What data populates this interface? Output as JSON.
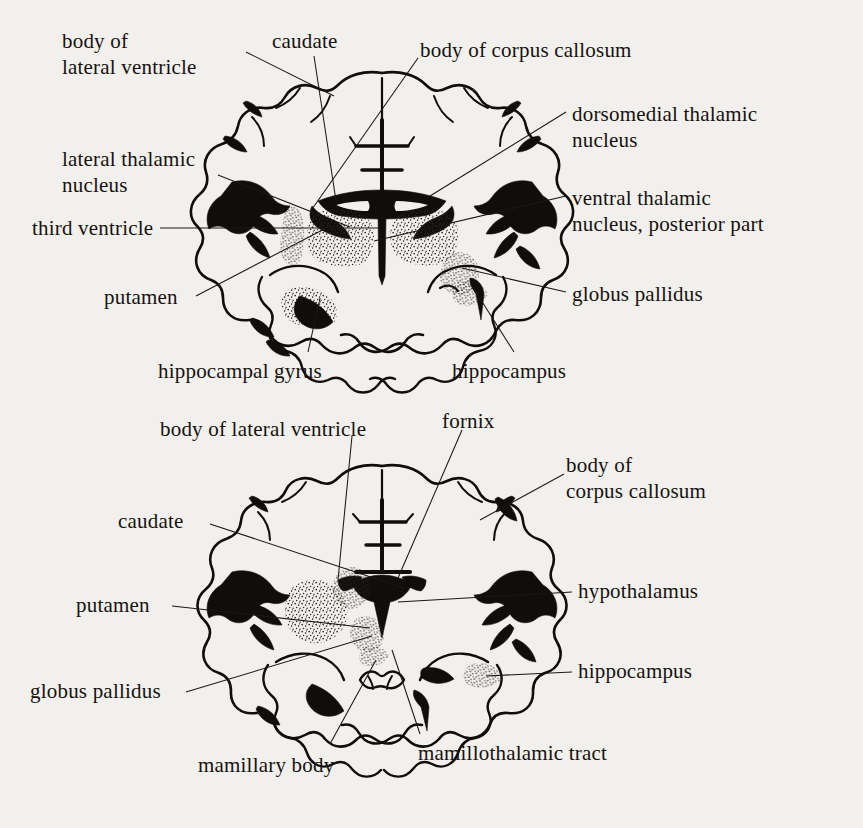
{
  "document": {
    "type": "anatomical-illustration",
    "subject": "Coronal sections of the human brain",
    "background_color": "#f2f0ec",
    "ink_color": "#16120f"
  },
  "figures": [
    {
      "id": "upper-coronal-section",
      "name": "Coronal section at the level of the thalamus",
      "labels": [
        {
          "id": "body-of-lateral-ventricle",
          "text": "body of\nlateral ventricle",
          "align": "left",
          "x": 62,
          "y": 28
        },
        {
          "id": "caudate",
          "text": "caudate",
          "align": "left",
          "x": 272,
          "y": 28
        },
        {
          "id": "body-of-corpus-callosum",
          "text": "body of corpus callosum",
          "align": "left",
          "x": 420,
          "y": 37
        },
        {
          "id": "dorsomedial-thalamic-nucleus",
          "text": "dorsomedial thalamic\nnucleus",
          "align": "left",
          "x": 572,
          "y": 101
        },
        {
          "id": "lateral-thalamic-nucleus",
          "text": "lateral thalamic\nnucleus",
          "align": "left",
          "x": 62,
          "y": 146
        },
        {
          "id": "ventral-thalamic-nucleus",
          "text": "ventral thalamic\nnucleus, posterior part",
          "align": "left",
          "x": 572,
          "y": 185
        },
        {
          "id": "third-ventricle",
          "text": "third ventricle",
          "align": "left",
          "x": 32,
          "y": 225
        },
        {
          "id": "globus-pallidus",
          "text": "globus pallidus",
          "align": "left",
          "x": 572,
          "y": 283
        },
        {
          "id": "putamen",
          "text": "putamen",
          "align": "left",
          "x": 104,
          "y": 293
        },
        {
          "id": "hippocampal-gyrus",
          "text": "hippocampal gyrus",
          "align": "left",
          "x": 158,
          "y": 360
        },
        {
          "id": "hippocampus",
          "text": "hippocampus",
          "align": "left",
          "x": 452,
          "y": 360
        }
      ]
    },
    {
      "id": "lower-coronal-section",
      "name": "Coronal section at the level of the mamillary bodies",
      "labels": [
        {
          "id": "body-of-lateral-ventricle-2",
          "text": "body of lateral ventricle",
          "align": "left",
          "x": 160,
          "y": 418
        },
        {
          "id": "fornix",
          "text": "fornix",
          "align": "left",
          "x": 442,
          "y": 412
        },
        {
          "id": "body-of-corpus-callosum-2",
          "text": "body of\ncorpus callosum",
          "align": "left",
          "x": 566,
          "y": 455
        },
        {
          "id": "caudate-2",
          "text": "caudate",
          "align": "left",
          "x": 118,
          "y": 514
        },
        {
          "id": "hypothalamus",
          "text": "hypothalamus",
          "align": "left",
          "x": 578,
          "y": 578
        },
        {
          "id": "putamen-2",
          "text": "putamen",
          "align": "left",
          "x": 76,
          "y": 597
        },
        {
          "id": "hippocampus-2",
          "text": "hippocampus",
          "align": "left",
          "x": 578,
          "y": 661
        },
        {
          "id": "globus-pallidus-2",
          "text": "globus pallidus",
          "align": "left",
          "x": 30,
          "y": 688
        },
        {
          "id": "mamillary-body",
          "text": "mamillary body",
          "align": "left",
          "x": 198,
          "y": 757
        },
        {
          "id": "mamillothalamic-tract",
          "text": "mamillothalamic tract",
          "align": "left",
          "x": 418,
          "y": 745
        }
      ]
    }
  ]
}
